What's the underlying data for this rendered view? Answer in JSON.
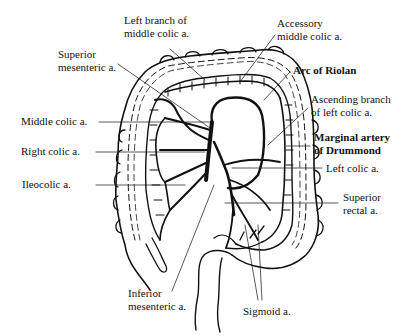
{
  "diagram": {
    "colors": {
      "ink": "#111111",
      "background": "#ffffff"
    },
    "labels": [
      {
        "id": "left-branch-middle-colic",
        "text": "Left branch of\nmiddle colic a.",
        "x": 124,
        "y": 20,
        "bold": false
      },
      {
        "id": "accessory-middle-colic",
        "text": "Accessory\nmiddle colic a.",
        "x": 277,
        "y": 22,
        "bold": false
      },
      {
        "id": "superior-mesenteric",
        "text": "Superior\nmesenteric a.",
        "x": 58,
        "y": 55,
        "bold": false
      },
      {
        "id": "arc-of-riolan",
        "text": "Arc of Riolan",
        "x": 293,
        "y": 65,
        "bold": true
      },
      {
        "id": "ascending-branch-left-colic",
        "text": "Ascending branch\nof left colic a.",
        "x": 311,
        "y": 94,
        "bold": false
      },
      {
        "id": "middle-colic",
        "text": "Middle colic a.",
        "x": 21,
        "y": 115,
        "bold": false
      },
      {
        "id": "marginal-artery-drummond",
        "text": "Marginal artery\nof Drummond",
        "x": 314,
        "y": 132,
        "bold": true
      },
      {
        "id": "right-colic",
        "text": "Right colic a.",
        "x": 21,
        "y": 145,
        "bold": false
      },
      {
        "id": "left-colic",
        "text": "Left colic a.",
        "x": 326,
        "y": 163,
        "bold": false
      },
      {
        "id": "ileocolic",
        "text": "Ileocolic a.",
        "x": 22,
        "y": 178,
        "bold": false
      },
      {
        "id": "superior-rectal",
        "text": "Superior\nrectal a.",
        "x": 343,
        "y": 192,
        "bold": false
      },
      {
        "id": "inferior-mesenteric",
        "text": "Inferior\nmesenteric a.",
        "x": 128,
        "y": 288,
        "bold": false
      },
      {
        "id": "sigmoid",
        "text": "Sigmoid a.",
        "x": 243,
        "y": 307,
        "bold": false
      }
    ]
  }
}
